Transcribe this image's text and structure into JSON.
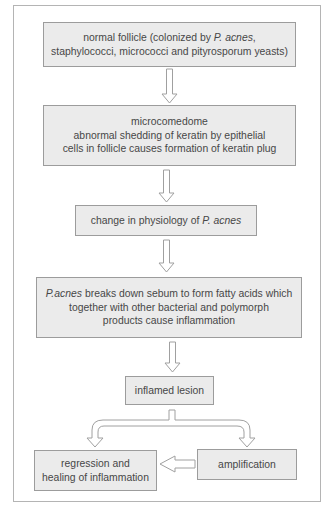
{
  "diagram": {
    "type": "flowchart",
    "nodes": [
      {
        "id": "normal_follicle",
        "lines": [
          {
            "pre": "normal follicle (colonized by ",
            "em": "P. acnes",
            "post": ","
          },
          {
            "pre": "staphylococci, micrococci and pityrosporum yeasts)",
            "em": "",
            "post": ""
          }
        ]
      },
      {
        "id": "microcomedome",
        "lines": [
          {
            "pre": "microcomedome",
            "em": "",
            "post": ""
          },
          {
            "pre": "abnormal shedding of keratin by epithelial",
            "em": "",
            "post": ""
          },
          {
            "pre": "cells in follicle causes formation of keratin plug",
            "em": "",
            "post": ""
          }
        ]
      },
      {
        "id": "physiology_change",
        "lines": [
          {
            "pre": "change in physiology of ",
            "em": "P. acnes",
            "post": ""
          }
        ]
      },
      {
        "id": "sebum_breakdown",
        "lines": [
          {
            "pre": "",
            "em": "P.acnes",
            "post": " breaks down sebum to form fatty acids which"
          },
          {
            "pre": "together with other bacterial and polymorph",
            "em": "",
            "post": ""
          },
          {
            "pre": "products cause inflammation",
            "em": "",
            "post": ""
          }
        ]
      },
      {
        "id": "inflamed_lesion",
        "lines": [
          {
            "pre": "inflamed lesion",
            "em": "",
            "post": ""
          }
        ]
      },
      {
        "id": "regression",
        "lines": [
          {
            "pre": "regression and",
            "em": "",
            "post": ""
          },
          {
            "pre": "healing of inflammation",
            "em": "",
            "post": ""
          }
        ]
      },
      {
        "id": "amplification",
        "lines": [
          {
            "pre": "amplification",
            "em": "",
            "post": ""
          }
        ]
      }
    ],
    "edges": [
      {
        "from": "normal_follicle",
        "to": "microcomedome"
      },
      {
        "from": "microcomedome",
        "to": "physiology_change"
      },
      {
        "from": "physiology_change",
        "to": "sebum_breakdown"
      },
      {
        "from": "sebum_breakdown",
        "to": "inflamed_lesion"
      },
      {
        "from": "inflamed_lesion",
        "to": "regression"
      },
      {
        "from": "inflamed_lesion",
        "to": "amplification"
      },
      {
        "from": "amplification",
        "to": "regression"
      }
    ],
    "colors": {
      "box_fill": "#ebebeb",
      "box_border": "#9c9c9c",
      "arrow_stroke": "#a0a0a0",
      "text": "#474747",
      "frame": "#b4b4b4"
    }
  }
}
